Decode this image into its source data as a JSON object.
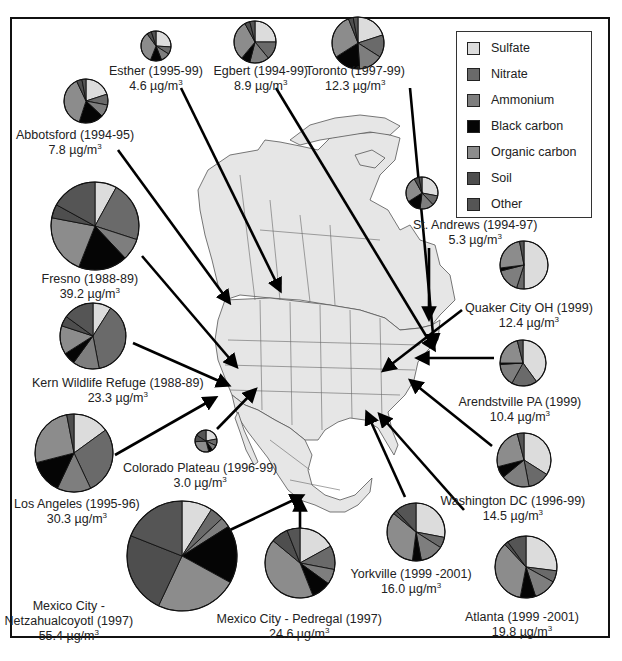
{
  "chart_data": {
    "type": "pie",
    "title": "",
    "unit": "µg/m3",
    "legend": {
      "position": "top-right",
      "entries": [
        {
          "key": "sulfate",
          "label": "Sulfate",
          "color": "#dcdcdc"
        },
        {
          "key": "nitrate",
          "label": "Nitrate",
          "color": "#6a6a6a"
        },
        {
          "key": "ammonium",
          "label": "Ammonium",
          "color": "#7e7e7e"
        },
        {
          "key": "black_carbon",
          "label": "Black carbon",
          "color": "#050505"
        },
        {
          "key": "organic_carbon",
          "label": "Organic carbon",
          "color": "#8c8c8c"
        },
        {
          "key": "soil",
          "label": "Soil",
          "color": "#4e4e4e"
        },
        {
          "key": "other",
          "label": "Other",
          "color": "#555555"
        }
      ]
    },
    "component_order": [
      "sulfate",
      "nitrate",
      "ammonium",
      "black_carbon",
      "organic_carbon",
      "soil",
      "other"
    ],
    "sites": [
      {
        "name": "Esther (1995-99)",
        "total": 4.6,
        "values": [
          26,
          8,
          10,
          12,
          34,
          5,
          5
        ],
        "pie": {
          "cx": 156,
          "cy": 46,
          "r": 15
        },
        "label_pos": {
          "x": 156,
          "y": 64
        },
        "arrow": [
          [
            181,
            88
          ],
          [
            280,
            290
          ]
        ]
      },
      {
        "name": "Egbert (1994-99)",
        "total": 8.9,
        "values": [
          25,
          14,
          15,
          7,
          31,
          4,
          4
        ],
        "pie": {
          "cx": 255,
          "cy": 42,
          "r": 21
        },
        "label_pos": {
          "x": 261,
          "y": 64
        },
        "arrow": [
          [
            276,
            88
          ],
          [
            434,
            349
          ]
        ]
      },
      {
        "name": "Toronto (1997-99)",
        "total": 12.3,
        "values": [
          20,
          14,
          15,
          17,
          28,
          3,
          3
        ],
        "pie": {
          "cx": 358,
          "cy": 43,
          "r": 26
        },
        "label_pos": {
          "x": 355,
          "y": 64
        },
        "arrow": [
          [
            410,
            88
          ],
          [
            434,
            345
          ]
        ]
      },
      {
        "name": "Abbotsford (1994-95)",
        "total": 7.8,
        "values": [
          20,
          8,
          9,
          18,
          38,
          4,
          3
        ],
        "pie": {
          "cx": 86,
          "cy": 101,
          "r": 22
        },
        "label_pos": {
          "x": 75,
          "y": 128
        },
        "arrow": [
          [
            118,
            150
          ],
          [
            229,
            302
          ]
        ]
      },
      {
        "name": "Fresno (1988-89)",
        "total": 39.2,
        "values": [
          8,
          22,
          8,
          18,
          22,
          5,
          17
        ],
        "pie": {
          "cx": 95,
          "cy": 226,
          "r": 44
        },
        "label_pos": {
          "x": 90,
          "y": 272
        },
        "arrow": [
          [
            142,
            256
          ],
          [
            236,
            366
          ]
        ]
      },
      {
        "name": "Kern Wildlife Refuge (1988-89)",
        "total": 23.3,
        "values": [
          9,
          38,
          13,
          6,
          14,
          5,
          15
        ],
        "pie": {
          "cx": 93,
          "cy": 336,
          "r": 33
        },
        "label_pos": {
          "x": 118,
          "y": 376
        },
        "arrow": [
          [
            133,
            343
          ],
          [
            228,
            385
          ]
        ]
      },
      {
        "name": "Los Angeles (1995-96)",
        "total": 30.3,
        "values": [
          15,
          28,
          14,
          14,
          26,
          3,
          0
        ],
        "pie": {
          "cx": 74,
          "cy": 453,
          "r": 39
        },
        "label_pos": {
          "x": 77,
          "y": 497
        },
        "arrow": [
          [
            115,
            455
          ],
          [
            215,
            398
          ]
        ]
      },
      {
        "name": "Colorado Plateau (1996-99)",
        "total": 3.0,
        "values": [
          22,
          10,
          8,
          6,
          28,
          10,
          16
        ],
        "pie": {
          "cx": 206,
          "cy": 441,
          "r": 11
        },
        "label_pos": {
          "x": 200,
          "y": 461
        },
        "arrow": [
          [
            217,
            429
          ],
          [
            255,
            390
          ]
        ]
      },
      {
        "name": "Mexico City - Netzahualcoyotl (1997)",
        "total": 55.4,
        "values": [
          9,
          4,
          3,
          17,
          24,
          24,
          19
        ],
        "pie": {
          "cx": 182,
          "cy": 556,
          "r": 55
        },
        "label_pos": {
          "x": 69,
          "y": 599
        },
        "arrow": [
          [
            230,
            530
          ],
          [
            302,
            496
          ]
        ]
      },
      {
        "name": "Mexico City - Pedregal (1997)",
        "total": 24.6,
        "values": [
          17,
          11,
          7,
          9,
          42,
          8,
          6
        ],
        "pie": {
          "cx": 300,
          "cy": 563,
          "r": 35
        },
        "label_pos": {
          "x": 299,
          "y": 612
        },
        "arrow": [
          [
            300,
            528
          ],
          [
            300,
            500
          ]
        ]
      },
      {
        "name": "St. Andrews (1994-97)",
        "total": 5.3,
        "values": [
          28,
          10,
          14,
          14,
          26,
          5,
          3
        ],
        "pie": {
          "cx": 422,
          "cy": 193,
          "r": 16
        },
        "label_pos": {
          "x": 475,
          "y": 218
        },
        "arrow": [
          [
            429,
            248
          ],
          [
            429,
            318
          ]
        ]
      },
      {
        "name": "Quaker City OH (1999)",
        "total": 12.4,
        "values": [
          50,
          5,
          16,
          2,
          24,
          0,
          3
        ],
        "pie": {
          "cx": 524,
          "cy": 265,
          "r": 24
        },
        "label_pos": {
          "x": 529,
          "y": 301
        },
        "arrow": [
          [
            462,
            310
          ],
          [
            384,
            370
          ]
        ]
      },
      {
        "name": "Arendstville PA (1999)",
        "total": 10.4,
        "values": [
          40,
          18,
          16,
          1,
          21,
          0,
          4
        ],
        "pie": {
          "cx": 523,
          "cy": 363,
          "r": 23
        },
        "label_pos": {
          "x": 520,
          "y": 395
        },
        "arrow": [
          [
            494,
            358
          ],
          [
            418,
            358
          ]
        ]
      },
      {
        "name": "Washington DC (1996-99)",
        "total": 14.5,
        "values": [
          34,
          13,
          17,
          7,
          25,
          0,
          4
        ],
        "pie": {
          "cx": 524,
          "cy": 460,
          "r": 27
        },
        "label_pos": {
          "x": 513,
          "y": 494
        },
        "arrow": [
          [
            492,
            446
          ],
          [
            411,
            381
          ]
        ]
      },
      {
        "name": "Yorkville (1999 -2001)",
        "total": 16.0,
        "values": [
          28,
          6,
          13,
          5,
          34,
          2,
          12
        ],
        "pie": {
          "cx": 416,
          "cy": 532,
          "r": 29
        },
        "label_pos": {
          "x": 411,
          "y": 567
        },
        "arrow": [
          [
            405,
            497
          ],
          [
            367,
            413
          ]
        ]
      },
      {
        "name": "Atlanta (1999 -2001)",
        "total": 19.8,
        "values": [
          27,
          6,
          12,
          8,
          35,
          2,
          10
        ],
        "pie": {
          "cx": 526,
          "cy": 567,
          "r": 31
        },
        "label_pos": {
          "x": 522,
          "y": 610
        },
        "arrow": [
          [
            464,
            510
          ],
          [
            380,
            415
          ]
        ]
      }
    ]
  },
  "legend_labels": [
    "Sulfate",
    "Nitrate",
    "Ammonium",
    "Black carbon",
    "Organic carbon",
    "Soil",
    "Other"
  ],
  "map": {
    "region": "North America",
    "fill": "#e6e6e6",
    "stroke": "#555555"
  }
}
